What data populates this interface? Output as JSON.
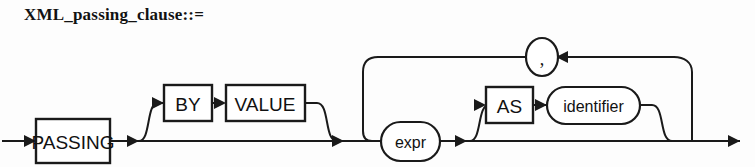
{
  "diagram": {
    "title": "XML_passing_clause::=",
    "type": "railroad-syntax-diagram",
    "line_color": "#1a1a1a",
    "background_color": "#fdfdfd",
    "nodes": [
      {
        "id": "passing",
        "label": "PASSING",
        "shape": "rectangle",
        "kind": "keyword"
      },
      {
        "id": "by",
        "label": "BY",
        "shape": "rectangle",
        "kind": "keyword"
      },
      {
        "id": "value",
        "label": "VALUE",
        "shape": "rectangle",
        "kind": "keyword"
      },
      {
        "id": "expr",
        "label": "expr",
        "shape": "oval",
        "kind": "nonterminal"
      },
      {
        "id": "as",
        "label": "AS",
        "shape": "rectangle",
        "kind": "keyword"
      },
      {
        "id": "identifier",
        "label": "identifier",
        "shape": "oval",
        "kind": "nonterminal"
      },
      {
        "id": "comma",
        "label": ",",
        "shape": "circle",
        "kind": "punctuation"
      }
    ],
    "paths": [
      {
        "from": "start",
        "to": "passing",
        "kind": "main"
      },
      {
        "from": "passing",
        "to": "expr",
        "kind": "main"
      },
      {
        "from": "passing",
        "to": "by",
        "kind": "optional-branch"
      },
      {
        "from": "by",
        "to": "value",
        "kind": "sequence"
      },
      {
        "from": "value",
        "to": "expr",
        "kind": "optional-rejoin"
      },
      {
        "from": "expr",
        "to": "end",
        "kind": "main"
      },
      {
        "from": "expr",
        "to": "as",
        "kind": "optional-branch"
      },
      {
        "from": "as",
        "to": "identifier",
        "kind": "sequence"
      },
      {
        "from": "identifier",
        "to": "end",
        "kind": "optional-rejoin"
      },
      {
        "from": "end",
        "to": "comma",
        "kind": "loop-back"
      },
      {
        "from": "comma",
        "to": "expr",
        "kind": "loop-back"
      }
    ]
  }
}
